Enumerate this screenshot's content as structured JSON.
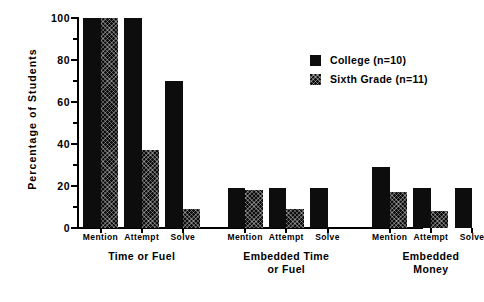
{
  "chart_data": {
    "type": "bar",
    "title": "",
    "xlabel": "",
    "ylabel": "Percentage  of  Students",
    "ylim": [
      0,
      100
    ],
    "yticks": [
      0,
      20,
      40,
      60,
      80,
      100
    ],
    "ytick_labels": [
      "0",
      "20",
      "40",
      "60",
      "80",
      "100"
    ],
    "grid": false,
    "legend_position": "upper right",
    "categories": [
      "Mention",
      "Attempt",
      "Solve",
      "Mention",
      "Attempt",
      "Solve",
      "Mention",
      "Attempt",
      "Solve"
    ],
    "groups": [
      {
        "label": "Time or Fuel",
        "categories": [
          "Mention",
          "Attempt",
          "Solve"
        ]
      },
      {
        "label": "Embedded Time\nor Fuel",
        "categories": [
          "Mention",
          "Attempt",
          "Solve"
        ]
      },
      {
        "label": "Embedded Money",
        "categories": [
          "Mention",
          "Attempt",
          "Solve"
        ]
      }
    ],
    "series": [
      {
        "name": "College (n=10)",
        "fill": "solid",
        "color": "#0d0d0d",
        "values": [
          100,
          100,
          70,
          19,
          19,
          19,
          29,
          19,
          19
        ]
      },
      {
        "name": "Sixth Grade (n=11)",
        "fill": "hatched",
        "color": "#0d0d0d",
        "values": [
          100,
          37,
          9,
          18,
          9,
          0,
          17,
          8,
          0
        ]
      }
    ]
  },
  "legend": {
    "entries": [
      {
        "label": "College (n=10)",
        "fill": "solid"
      },
      {
        "label": "Sixth Grade (n=11)",
        "fill": "hatched"
      }
    ]
  }
}
